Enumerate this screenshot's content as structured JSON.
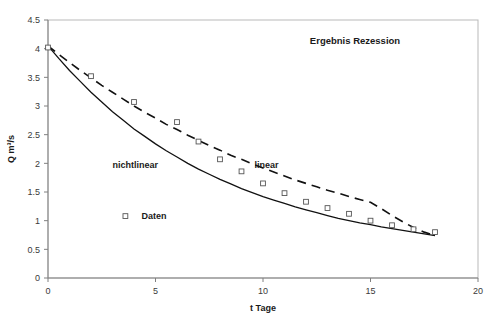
{
  "chart_data": {
    "type": "line",
    "title": "Ergebnis Rezession",
    "xlabel": "t  Tage",
    "ylabel": "Q  m³/s",
    "xlim": [
      0,
      20
    ],
    "ylim": [
      0,
      4.5
    ],
    "xticks": [
      0,
      5,
      10,
      15,
      20
    ],
    "xtick_labels": [
      "0",
      "5",
      "10",
      "15",
      "20"
    ],
    "yticks": [
      0,
      0.5,
      1,
      1.5,
      2,
      2.5,
      3,
      3.5,
      4,
      4.5
    ],
    "ytick_labels": [
      "0",
      "0.5",
      "1",
      "1.5",
      "2",
      "2.5",
      "3",
      "3.5",
      "4",
      "4.5"
    ],
    "grid": false,
    "legend_position": "inside-left",
    "annotations": [
      {
        "text": "nichtlinear",
        "x": 3.0,
        "y": 1.92
      },
      {
        "text": "linear",
        "x": 9.6,
        "y": 1.92
      }
    ],
    "legend": [
      {
        "label": "Daten",
        "marker": "open-square",
        "x": 3.6,
        "y": 1.08
      }
    ],
    "series": [
      {
        "name": "Daten",
        "style": "markers",
        "marker": "open-square",
        "x": [
          0,
          2,
          4,
          6,
          7,
          8,
          9,
          10,
          11,
          12,
          13,
          14,
          15,
          16,
          17,
          18
        ],
        "y": [
          4.02,
          3.52,
          3.07,
          2.72,
          2.38,
          2.07,
          1.86,
          1.65,
          1.48,
          1.33,
          1.22,
          1.12,
          1.0,
          0.92,
          0.85,
          0.8
        ]
      },
      {
        "name": "nichtlinear",
        "style": "solid-line",
        "x": [
          0,
          0.5,
          1,
          1.5,
          2,
          2.5,
          3,
          3.5,
          4,
          4.5,
          5,
          5.5,
          6,
          6.5,
          7,
          7.5,
          8,
          8.5,
          9,
          9.5,
          10,
          10.5,
          11,
          11.5,
          12,
          12.5,
          13,
          13.5,
          14,
          14.5,
          15,
          15.5,
          16,
          16.5,
          17,
          17.5,
          18
        ],
        "y": [
          4.05,
          3.83,
          3.62,
          3.43,
          3.24,
          3.07,
          2.9,
          2.75,
          2.6,
          2.47,
          2.34,
          2.22,
          2.11,
          2.0,
          1.9,
          1.81,
          1.72,
          1.64,
          1.56,
          1.49,
          1.42,
          1.36,
          1.3,
          1.24,
          1.19,
          1.14,
          1.09,
          1.04,
          1.0,
          0.96,
          0.93,
          0.89,
          0.86,
          0.83,
          0.8,
          0.77,
          0.74
        ]
      },
      {
        "name": "linear",
        "style": "dashed-line",
        "x": [
          0,
          0.5,
          1,
          1.5,
          2,
          2.5,
          3,
          3.5,
          4,
          4.5,
          5,
          5.5,
          6,
          6.5,
          7,
          7.5,
          8,
          8.5,
          9,
          9.5,
          10,
          10.5,
          11,
          11.5,
          12,
          12.5,
          13,
          13.5,
          14,
          14.5,
          15,
          15.5,
          16,
          16.5,
          17,
          17.5,
          18
        ],
        "y": [
          4.05,
          3.9,
          3.76,
          3.62,
          3.49,
          3.36,
          3.24,
          3.12,
          3.0,
          2.89,
          2.79,
          2.68,
          2.59,
          2.49,
          2.4,
          2.31,
          2.23,
          2.14,
          2.07,
          1.99,
          1.92,
          1.85,
          1.78,
          1.71,
          1.65,
          1.59,
          1.53,
          1.48,
          1.42,
          1.37,
          1.32,
          1.21,
          1.09,
          0.98,
          0.88,
          0.8,
          0.74
        ]
      }
    ],
    "colors": {
      "line": "#111111",
      "axis": "#808080",
      "border": "#b9b9b9",
      "text": "#1a1a1a",
      "marker_edge": "#555555",
      "background": "#ffffff"
    }
  }
}
